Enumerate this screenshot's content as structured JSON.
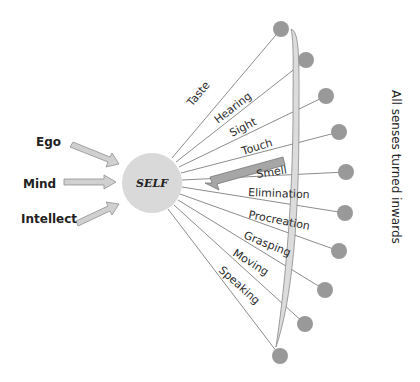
{
  "center": {
    "label": "SELF",
    "fill": "#d9d9d9"
  },
  "inputs": [
    {
      "label": "Ego"
    },
    {
      "label": "Mind"
    },
    {
      "label": "Intellect"
    }
  ],
  "senses": [
    {
      "label": "Taste"
    },
    {
      "label": "Hearing"
    },
    {
      "label": "Sight"
    },
    {
      "label": "Touch"
    },
    {
      "label": "Smell"
    },
    {
      "label": "Elimination"
    },
    {
      "label": "Procreation"
    },
    {
      "label": "Grasping"
    },
    {
      "label": "Moving"
    },
    {
      "label": "Speaking"
    }
  ],
  "caption": "All senses turned inwards",
  "colors": {
    "node": "#999999",
    "line": "#8c8c8c",
    "arrow": "#bfbfbf",
    "arrow_dark": "#8a8a8a"
  }
}
